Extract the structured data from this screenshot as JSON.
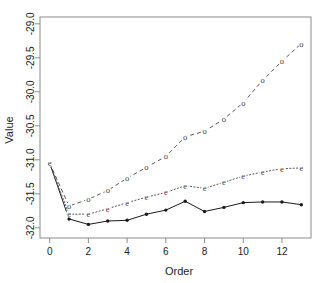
{
  "chart_data": {
    "type": "line",
    "title": "",
    "xlabel": "Order",
    "ylabel": "Value",
    "xlim": [
      -0.5,
      13.5
    ],
    "ylim": [
      -32.15,
      -28.9
    ],
    "grid": false,
    "legend": "none",
    "xticks": [
      0,
      2,
      4,
      6,
      8,
      10,
      12
    ],
    "xtick_labels": [
      "0",
      "2",
      "4",
      "6",
      "8",
      "10",
      "12"
    ],
    "yticks": [
      -32.0,
      -31.5,
      -31.0,
      -30.5,
      -30.0,
      -29.5,
      -29.0
    ],
    "ytick_labels": [
      "-32.0",
      "-31.5",
      "-31.0",
      "-30.5",
      "-30.0",
      "-29.5",
      "-29.0"
    ],
    "x": [
      0,
      1,
      2,
      3,
      4,
      5,
      6,
      7,
      8,
      9,
      10,
      11,
      12,
      13
    ],
    "series": [
      {
        "name": "solid-filled-point-series",
        "marker": "filled-circle",
        "linestyle": "solid",
        "values": [
          -31.05,
          -31.87,
          -31.95,
          -31.9,
          -31.89,
          -31.8,
          -31.74,
          -31.61,
          -31.76,
          -31.7,
          -31.63,
          -31.62,
          -31.62,
          -31.66
        ]
      },
      {
        "name": "dashed-o-marker-series",
        "marker": "o",
        "linestyle": "dashed",
        "values": [
          -31.05,
          -31.68,
          -31.58,
          -31.45,
          -31.27,
          -31.11,
          -30.95,
          -30.66,
          -30.58,
          -30.4,
          -30.16,
          -29.83,
          -29.55,
          -29.29
        ]
      },
      {
        "name": "dotted-e-marker-series",
        "marker": "e",
        "linestyle": "dotted",
        "values": [
          -31.05,
          -31.8,
          -31.8,
          -31.72,
          -31.63,
          -31.55,
          -31.48,
          -31.38,
          -31.42,
          -31.33,
          -31.24,
          -31.18,
          -31.13,
          -31.12
        ]
      }
    ]
  }
}
